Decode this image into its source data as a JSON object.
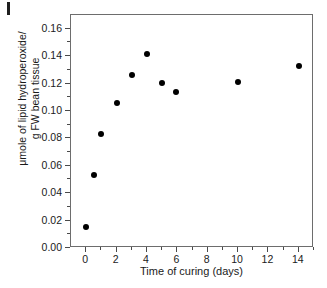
{
  "figure": {
    "corner_mark": "page-edge-mark"
  },
  "chart_data": {
    "type": "scatter",
    "title": "",
    "xlabel": "Time of curing (days)",
    "ylabel": "μmole of lipid hydroperoxide/ g FW bean tissue",
    "ylabel_lines": [
      "μmole of lipid hydroperoxide/",
      "g FW bean tissue"
    ],
    "xlim": [
      -1,
      15
    ],
    "ylim": [
      0.0,
      0.17
    ],
    "grid": false,
    "legend": null,
    "marker": "filled-circle",
    "marker_color": "#000000",
    "x_ticks": [
      0,
      2,
      4,
      6,
      8,
      10,
      12,
      14
    ],
    "x_tick_labels": [
      "0",
      "2",
      "4",
      "6",
      "8",
      "10",
      "12",
      "14"
    ],
    "x_minor_ticks": [
      1,
      3,
      5,
      7,
      9,
      11,
      13,
      15
    ],
    "y_ticks": [
      0.0,
      0.02,
      0.04,
      0.06,
      0.08,
      0.1,
      0.12,
      0.14,
      0.16
    ],
    "y_tick_labels": [
      "0.00",
      "0.02",
      "0.04",
      "0.06",
      "0.08",
      "0.10",
      "0.12",
      "0.14",
      "0.16"
    ],
    "x": [
      0,
      0.5,
      1,
      2,
      3,
      4,
      5,
      5.9,
      10,
      14
    ],
    "y": [
      0.015,
      0.0535,
      0.0835,
      0.1058,
      0.1265,
      0.1418,
      0.1205,
      0.114,
      0.121,
      0.133
    ],
    "points": [
      {
        "x": 0,
        "y": 0.015
      },
      {
        "x": 0.5,
        "y": 0.0535
      },
      {
        "x": 1,
        "y": 0.0835
      },
      {
        "x": 2,
        "y": 0.1058
      },
      {
        "x": 3,
        "y": 0.1265
      },
      {
        "x": 4,
        "y": 0.1418
      },
      {
        "x": 5,
        "y": 0.1205
      },
      {
        "x": 5.9,
        "y": 0.114
      },
      {
        "x": 10,
        "y": 0.121
      },
      {
        "x": 14,
        "y": 0.133
      }
    ]
  }
}
